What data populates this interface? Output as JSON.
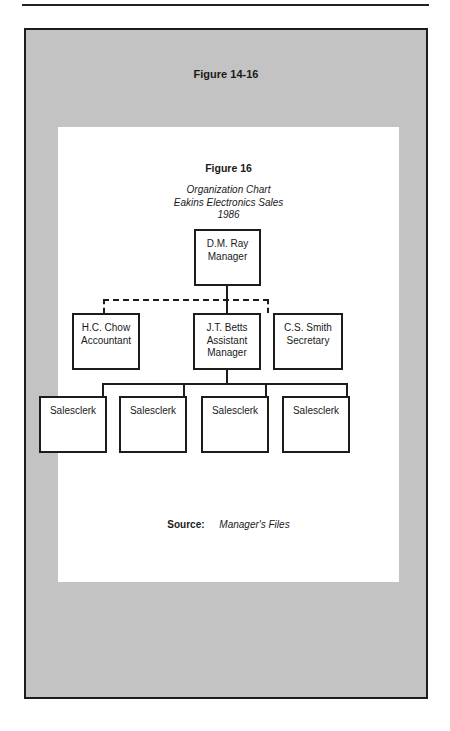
{
  "outer_figure": {
    "title": "Figure 14-16"
  },
  "figure": {
    "title": "Figure 16",
    "subtitle_lines": [
      "Organization Chart",
      "Eakins Electronics Sales",
      "1986"
    ],
    "org_chart": {
      "root": {
        "name": "D.M. Ray",
        "role": "Manager"
      },
      "level2": [
        {
          "name": "H.C. Chow",
          "role": "Accountant",
          "link": "dashed"
        },
        {
          "name": "J.T. Betts",
          "role": "Assistant",
          "role2": "Manager",
          "link": "solid"
        },
        {
          "name": "C.S. Smith",
          "role": "Secretary",
          "link": "dashed"
        }
      ],
      "level3_parent": "J.T. Betts",
      "level3": [
        {
          "role": "Salesclerk"
        },
        {
          "role": "Salesclerk"
        },
        {
          "role": "Salesclerk"
        },
        {
          "role": "Salesclerk"
        }
      ]
    },
    "source": {
      "label": "Source:",
      "value": "Manager's Files"
    }
  },
  "colors": {
    "frame_gray": "#c3c3c3",
    "panel": "#ffffff",
    "ink": "#1c1c1c"
  }
}
